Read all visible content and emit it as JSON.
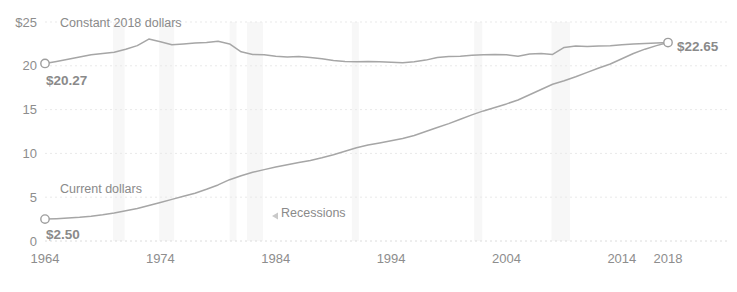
{
  "chart_data": {
    "type": "line",
    "title": "",
    "xlabel": "",
    "ylabel": "",
    "xlim": [
      1964,
      2018
    ],
    "ylim": [
      0,
      25
    ],
    "grid": true,
    "legend_position": "inline-annotation",
    "y_ticks": [
      "$25",
      "20",
      "15",
      "10",
      "5",
      "0"
    ],
    "y_tick_values": [
      25,
      20,
      15,
      10,
      5,
      0
    ],
    "x_ticks": [
      "1964",
      "1974",
      "1984",
      "1994",
      "2004",
      "2014",
      "2018"
    ],
    "x_tick_values": [
      1964,
      1974,
      1984,
      1994,
      2004,
      2014,
      2018
    ],
    "annotations": {
      "constant_series_label": "Constant 2018 dollars",
      "current_series_label": "Current dollars",
      "recessions_label": "Recessions",
      "start_value_constant": "$20.27",
      "start_value_current": "$2.50",
      "end_value": "$22.65"
    },
    "series": [
      {
        "name": "Constant 2018 dollars",
        "x": [
          1964,
          1965,
          1966,
          1967,
          1968,
          1969,
          1970,
          1971,
          1972,
          1973,
          1974,
          1975,
          1976,
          1977,
          1978,
          1979,
          1980,
          1981,
          1982,
          1983,
          1984,
          1985,
          1986,
          1987,
          1988,
          1989,
          1990,
          1991,
          1992,
          1993,
          1994,
          1995,
          1996,
          1997,
          1998,
          1999,
          2000,
          2001,
          2002,
          2003,
          2004,
          2005,
          2006,
          2007,
          2008,
          2009,
          2010,
          2011,
          2012,
          2013,
          2014,
          2015,
          2016,
          2017,
          2018
        ],
        "values": [
          20.27,
          20.5,
          20.75,
          21.0,
          21.25,
          21.4,
          21.55,
          21.9,
          22.3,
          23.05,
          22.75,
          22.4,
          22.5,
          22.6,
          22.65,
          22.8,
          22.5,
          21.6,
          21.3,
          21.25,
          21.1,
          21.0,
          21.05,
          20.95,
          20.8,
          20.6,
          20.5,
          20.45,
          20.5,
          20.45,
          20.4,
          20.35,
          20.45,
          20.65,
          20.95,
          21.05,
          21.1,
          21.2,
          21.25,
          21.3,
          21.25,
          21.1,
          21.35,
          21.4,
          21.3,
          22.1,
          22.25,
          22.2,
          22.25,
          22.3,
          22.4,
          22.5,
          22.55,
          22.6,
          22.65
        ]
      },
      {
        "name": "Current dollars",
        "x": [
          1964,
          1965,
          1966,
          1967,
          1968,
          1969,
          1970,
          1971,
          1972,
          1973,
          1974,
          1975,
          1976,
          1977,
          1978,
          1979,
          1980,
          1981,
          1982,
          1983,
          1984,
          1985,
          1986,
          1987,
          1988,
          1989,
          1990,
          1991,
          1992,
          1993,
          1994,
          1995,
          1996,
          1997,
          1998,
          1999,
          2000,
          2001,
          2002,
          2003,
          2004,
          2005,
          2006,
          2007,
          2008,
          2009,
          2010,
          2011,
          2012,
          2013,
          2014,
          2015,
          2016,
          2017,
          2018
        ],
        "values": [
          2.5,
          2.55,
          2.62,
          2.7,
          2.83,
          3.0,
          3.2,
          3.45,
          3.7,
          4.05,
          4.4,
          4.75,
          5.1,
          5.45,
          5.9,
          6.4,
          7.0,
          7.45,
          7.85,
          8.15,
          8.45,
          8.7,
          8.95,
          9.2,
          9.5,
          9.85,
          10.25,
          10.65,
          10.95,
          11.2,
          11.45,
          11.7,
          12.05,
          12.5,
          12.95,
          13.4,
          13.9,
          14.4,
          14.85,
          15.25,
          15.65,
          16.1,
          16.7,
          17.3,
          17.9,
          18.3,
          18.75,
          19.25,
          19.75,
          20.2,
          20.8,
          21.4,
          21.9,
          22.3,
          22.65
        ]
      }
    ],
    "recessions": [
      {
        "start": 1969.9,
        "end": 1970.9
      },
      {
        "start": 1973.9,
        "end": 1975.2
      },
      {
        "start": 1980.0,
        "end": 1980.6
      },
      {
        "start": 1981.5,
        "end": 1982.9
      },
      {
        "start": 1990.6,
        "end": 1991.2
      },
      {
        "start": 2001.2,
        "end": 2001.9
      },
      {
        "start": 2007.9,
        "end": 2009.5
      }
    ],
    "colors": {
      "line": "#a6a6a6",
      "grid": "#e9e9e9",
      "recession_band": "#f7f7f7",
      "tick_text": "#8d8d8d",
      "value_label": "#2b2b2b",
      "series_label": "#cfcfcf"
    }
  }
}
